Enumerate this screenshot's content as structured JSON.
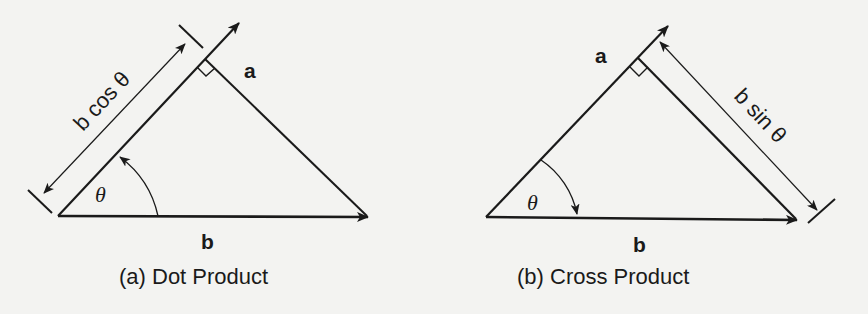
{
  "figure": {
    "background_color": "#f3f3f1",
    "line_color": "#1a1a1a",
    "panels": [
      {
        "id": "a",
        "caption": "(a) Dot Product",
        "vector_a_label": "a",
        "vector_b_label": "b",
        "angle_label": "θ",
        "dimension_label": "b cos θ",
        "dimension_meaning": "projection of b onto a",
        "angle_arrow_direction": "from b toward a",
        "right_angle_marker": true
      },
      {
        "id": "b",
        "caption": "(b) Cross Product",
        "vector_a_label": "a",
        "vector_b_label": "b",
        "angle_label": "θ",
        "dimension_label": "b sin θ",
        "dimension_meaning": "perpendicular component of b relative to a",
        "angle_arrow_direction": "from a toward b",
        "right_angle_marker": true
      }
    ]
  }
}
